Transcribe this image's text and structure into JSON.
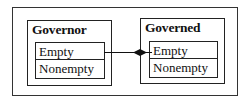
{
  "diagram": {
    "packages": [
      {
        "title": "Governor",
        "states": [
          "Empty",
          "Nonempty"
        ]
      },
      {
        "title": "Governed",
        "states": [
          "Empty",
          "Nonempty"
        ]
      }
    ],
    "connector": {
      "from": "Governor.Empty",
      "to": "Governed.Empty",
      "end": "filled-diamond"
    }
  }
}
